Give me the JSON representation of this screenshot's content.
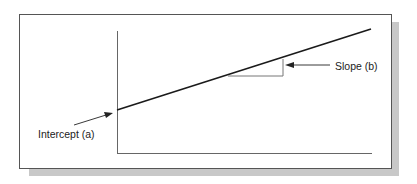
{
  "diagram": {
    "type": "linear-regression-illustration",
    "labels": {
      "intercept": "Intercept (a)",
      "slope": "Slope (b)"
    },
    "colors": {
      "frame": "#555555",
      "shadow": "#c8c8c8",
      "line": "#1a1a1a",
      "axis": "#666666"
    }
  }
}
